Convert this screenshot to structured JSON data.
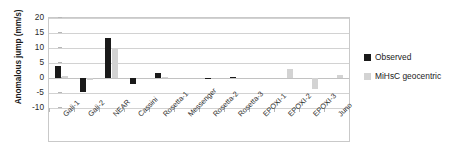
{
  "chart_data": {
    "type": "bar",
    "title": "",
    "xlabel": "",
    "ylabel": "Anomalous jump (mm/s)",
    "ylim": [
      -10,
      20
    ],
    "yticks": [
      20,
      15,
      10,
      5,
      0,
      -5,
      -10
    ],
    "ytick_labels": [
      "20",
      "15",
      "10",
      "5",
      "0",
      "-5",
      "-10"
    ],
    "grid": true,
    "legend_position": "right",
    "categories": [
      "Gali-1",
      "Gali-2",
      "NEAR",
      "Cassini",
      "Rosetta-1",
      "Messenger",
      "Rosetta-2",
      "Rosetta-3",
      "EPOXI-1",
      "EPOXI-2",
      "EPOXI-3",
      "Juno"
    ],
    "series": [
      {
        "name": "Observed",
        "color": "#1a1a1a",
        "values": [
          3.9,
          -4.6,
          13.2,
          -2.0,
          1.8,
          0.0,
          0.15,
          0.25,
          0.0,
          0.0,
          0.0,
          0.0
        ]
      },
      {
        "name": "MiHsC geocentric",
        "color": "#d3d3d3",
        "values": [
          0.6,
          -0.8,
          10.0,
          0.0,
          0.2,
          0.0,
          0.0,
          0.0,
          0.0,
          3.0,
          -3.5,
          1.0
        ]
      }
    ]
  },
  "legend": {
    "items": [
      {
        "label": "Observed",
        "color": "#1a1a1a"
      },
      {
        "label": "MiHsC geocentric",
        "color": "#d3d3d3"
      }
    ]
  }
}
